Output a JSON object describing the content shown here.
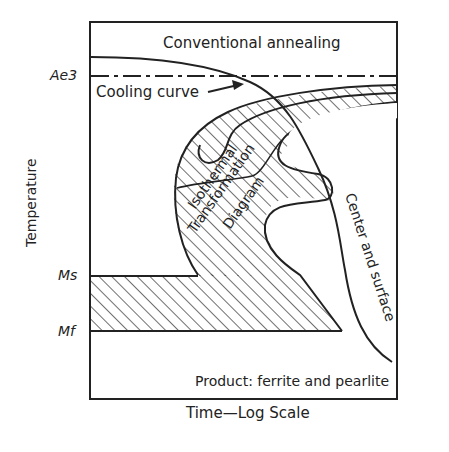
{
  "diagram": {
    "title_region": "Conventional annealing",
    "y_axis_label": "Temperature",
    "x_axis_label": "Time—Log Scale",
    "levels": [
      {
        "id": "ae3",
        "label": "Ae3"
      },
      {
        "id": "ms",
        "label": "Ms"
      },
      {
        "id": "mf",
        "label": "Mf"
      }
    ],
    "annotations": {
      "cooling_curve": "Cooling curve",
      "itd_line1": "Isothermal",
      "itd_line2": "Transformation",
      "itd_line3": "Diagram",
      "center_surface": "Center and surface",
      "product": "Product: ferrite and pearlite"
    },
    "colors": {
      "ink": "#222222",
      "background": "#ffffff"
    }
  }
}
